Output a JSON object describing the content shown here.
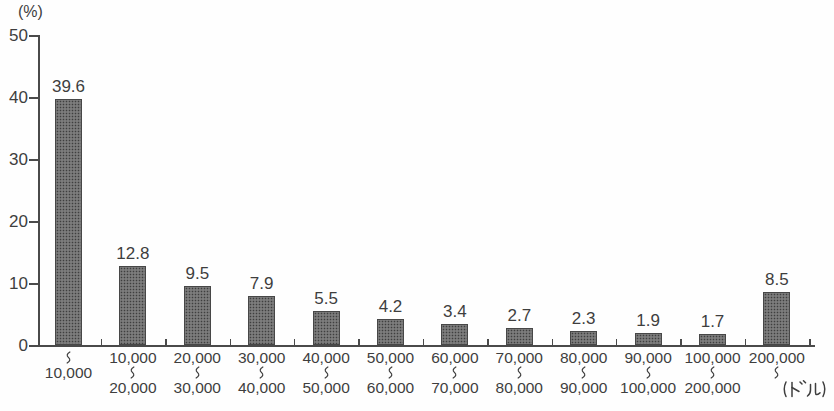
{
  "chart_data": {
    "type": "bar",
    "title": "",
    "y_unit_label": "(%)",
    "x_unit_label": "(ドル)",
    "ylim": [
      0,
      50
    ],
    "yticks": [
      0,
      10,
      20,
      30,
      40,
      50
    ],
    "grid": false,
    "legend_position": "none",
    "bar_fill": "#b9b9b9",
    "bar_dot_color": "#3f3f3f",
    "bar_border_color": "#474747",
    "axis_color": "#4a4a4a",
    "text_color": "#3e3e3e",
    "range_separator": "〜",
    "categories": [
      {
        "label": "〜10,000",
        "from": "",
        "to": "10,000"
      },
      {
        "label": "10,000〜20,000",
        "from": "10,000",
        "to": "20,000"
      },
      {
        "label": "20,000〜30,000",
        "from": "20,000",
        "to": "30,000"
      },
      {
        "label": "30,000〜40,000",
        "from": "30,000",
        "to": "40,000"
      },
      {
        "label": "40,000〜50,000",
        "from": "40,000",
        "to": "50,000"
      },
      {
        "label": "50,000〜60,000",
        "from": "50,000",
        "to": "60,000"
      },
      {
        "label": "60,000〜70,000",
        "from": "60,000",
        "to": "70,000"
      },
      {
        "label": "70,000〜80,000",
        "from": "70,000",
        "to": "80,000"
      },
      {
        "label": "80,000〜90,000",
        "from": "80,000",
        "to": "90,000"
      },
      {
        "label": "90,000〜100,000",
        "from": "90,000",
        "to": "100,000"
      },
      {
        "label": "100,000〜200,000",
        "from": "100,000",
        "to": "200,000"
      },
      {
        "label": "200,000〜",
        "from": "200,000",
        "to": ""
      }
    ],
    "values": [
      39.6,
      12.8,
      9.5,
      7.9,
      5.5,
      4.2,
      3.4,
      2.7,
      2.3,
      1.9,
      1.7,
      8.5
    ],
    "value_labels": [
      "39.6",
      "12.8",
      "9.5",
      "7.9",
      "5.5",
      "4.2",
      "3.4",
      "2.7",
      "2.3",
      "1.9",
      "1.7",
      "8.5"
    ]
  }
}
